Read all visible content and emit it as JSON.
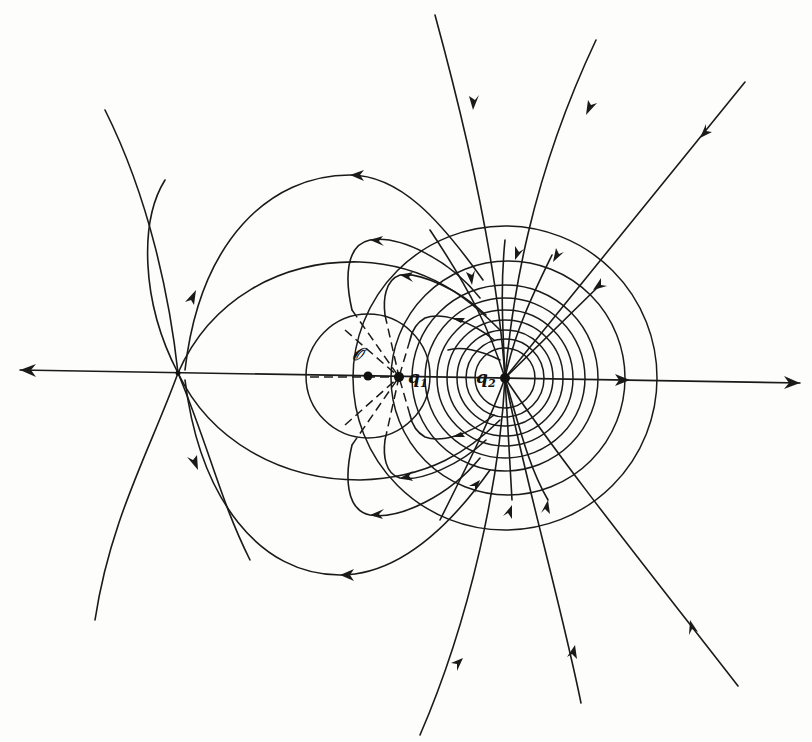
{
  "figure": {
    "type": "electric-field-line diagram",
    "labels": {
      "origin": "𝒪",
      "q1": "q",
      "q1_sub": "1",
      "q2": "q",
      "q2_sub": "2"
    },
    "points": {
      "origin": {
        "x": 368,
        "y": 376
      },
      "q1": {
        "x": 399,
        "y": 377
      },
      "q2": {
        "x": 505,
        "y": 378
      },
      "neutral_point": {
        "x": 178,
        "y": 373
      }
    },
    "colors": {
      "ink": "#1a1a1a",
      "paper": "#fdfdfc"
    },
    "line_styles": {
      "field_line": "solid with arrowheads",
      "inner_field_line": "dashed (inside sphere)",
      "equipotential": "solid circles"
    }
  }
}
